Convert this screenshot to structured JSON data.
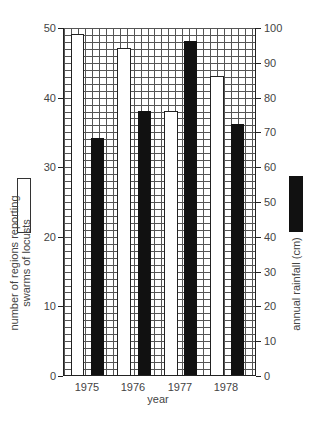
{
  "chart_data": {
    "type": "bar",
    "title": "",
    "xlabel": "year",
    "categories": [
      "1975",
      "1976",
      "1977",
      "1978"
    ],
    "series": [
      {
        "name": "number of regions reporting swarms of locusts",
        "axis": "left",
        "fill": "white",
        "values": [
          49,
          47,
          38,
          43
        ]
      },
      {
        "name": "annual rainfall (cm)",
        "axis": "right",
        "fill": "black",
        "values": [
          68,
          76,
          96,
          72
        ]
      }
    ],
    "ylabel_left": "number of regions reporting swarms of locusts",
    "ylabel_right": "annual rainfall (cm)",
    "ylim_left": [
      0,
      50
    ],
    "ylim_right": [
      0,
      100
    ],
    "yticks_left": [
      0,
      10,
      20,
      30,
      40,
      50
    ],
    "yticks_right": [
      0,
      10,
      20,
      30,
      40,
      50,
      60,
      70,
      80,
      90,
      100
    ],
    "grid": true,
    "legend_position": "left and right of plot (rotated labels with swatches)"
  },
  "labels": {
    "xaxis_title": "year",
    "years": [
      "1975",
      "1976",
      "1977",
      "1978"
    ],
    "left_ticks": [
      "0",
      "10",
      "20",
      "30",
      "40",
      "50"
    ],
    "right_ticks": [
      "0",
      "10",
      "20",
      "30",
      "40",
      "50",
      "60",
      "70",
      "80",
      "90",
      "100"
    ],
    "legend_left_line1": "number of regions reporting",
    "legend_left_line2": "swarms of locusts",
    "legend_right": "annual rainfall (cm)"
  },
  "colors": {
    "white_bar": "#ffffff",
    "black_bar": "#111111",
    "grid": "#555555"
  }
}
